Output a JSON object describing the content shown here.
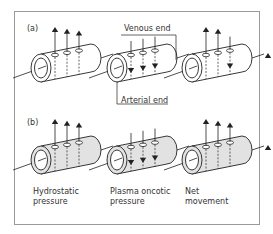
{
  "panels": [
    {
      "label": "(a)",
      "fill": "#ffffff",
      "vessels": [
        {
          "name": "hydrostatic",
          "arrows": [
            "out",
            "out",
            "out"
          ]
        },
        {
          "name": "oncotic",
          "arrows": [
            "in",
            "in",
            "in"
          ]
        },
        {
          "name": "net",
          "arrows": [
            "out",
            "out",
            "in"
          ]
        }
      ],
      "annotations": {
        "venous": "Venous end",
        "arterial": "Arterial end"
      }
    },
    {
      "label": "(b)",
      "fill": "#e2e2e2",
      "vessels": [
        {
          "name": "hydrostatic",
          "arrows": [
            "out",
            "out",
            "out"
          ]
        },
        {
          "name": "oncotic",
          "arrows": [
            "in",
            "in",
            "in"
          ]
        },
        {
          "name": "net",
          "arrows": [
            "out",
            "out",
            "out"
          ]
        }
      ]
    }
  ],
  "captions": {
    "hydrostatic": [
      "Hydrostatic",
      "pressure"
    ],
    "oncotic": [
      "Plasma oncotic",
      "pressure"
    ],
    "net": [
      "Net",
      "movement"
    ]
  },
  "colors": {
    "line": "#222222",
    "frame": "#9a9a9a",
    "shade_b": "#e2e2e2"
  }
}
